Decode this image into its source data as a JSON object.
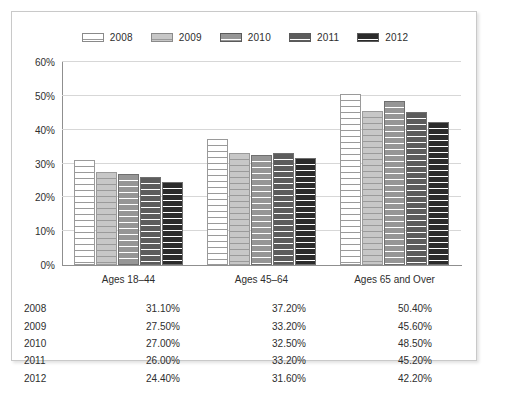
{
  "chart_data": {
    "type": "bar",
    "title": "",
    "subtitle": "",
    "xlabel": "",
    "ylabel": "",
    "categories": [
      "Ages 18–44",
      "Ages 45–64",
      "Ages 65 and Over"
    ],
    "series": [
      {
        "name": "2008",
        "values": [
          31.1,
          37.2,
          50.4
        ],
        "color": "#ffffff"
      },
      {
        "name": "2009",
        "values": [
          27.5,
          33.2,
          45.6
        ],
        "color": "#c7c7c7"
      },
      {
        "name": "2010",
        "values": [
          27.0,
          32.5,
          48.5
        ],
        "color": "#969696"
      },
      {
        "name": "2011",
        "values": [
          26.0,
          33.2,
          45.2
        ],
        "color": "#5c5c5c"
      },
      {
        "name": "2012",
        "values": [
          24.4,
          31.6,
          42.2
        ],
        "color": "#2b2b2b"
      }
    ],
    "ylim": [
      0,
      60
    ],
    "yticks": [
      0,
      10,
      20,
      30,
      40,
      50,
      60
    ],
    "ytick_labels": [
      "0%",
      "10%",
      "20%",
      "30%",
      "40%",
      "50%",
      "60%"
    ],
    "grid": true,
    "legend_position": "top",
    "bar_fill": "horizontal-striped"
  },
  "legend": {
    "items": [
      {
        "label": "2008",
        "swatch": "legend-swatch-2008"
      },
      {
        "label": "2009",
        "swatch": "legend-swatch-2009"
      },
      {
        "label": "2010",
        "swatch": "legend-swatch-2010"
      },
      {
        "label": "2011",
        "swatch": "legend-swatch-2011"
      },
      {
        "label": "2012",
        "swatch": "legend-swatch-2012"
      }
    ]
  },
  "table": {
    "rows": [
      {
        "year": "2008",
        "cells": [
          "31.10%",
          "37.20%",
          "50.40%"
        ]
      },
      {
        "year": "2009",
        "cells": [
          "27.50%",
          "33.20%",
          "45.60%"
        ]
      },
      {
        "year": "2010",
        "cells": [
          "27.00%",
          "32.50%",
          "48.50%"
        ]
      },
      {
        "year": "2011",
        "cells": [
          "26.00%",
          "33.20%",
          "45.20%"
        ]
      },
      {
        "year": "2012",
        "cells": [
          "24.40%",
          "31.60%",
          "42.20%"
        ]
      }
    ]
  }
}
